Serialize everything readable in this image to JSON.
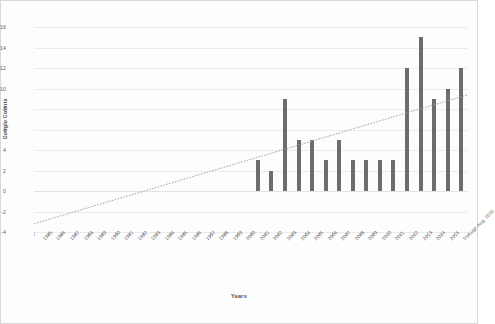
{
  "chart_data": {
    "type": "bar",
    "title": "",
    "xlabel": "Years",
    "ylabel": "Google Counts",
    "ylim": [
      -4,
      16
    ],
    "yticks": [
      16,
      14,
      12,
      10,
      8,
      6,
      4,
      2,
      0,
      -2,
      -4
    ],
    "grid": true,
    "legend": "none",
    "bar_color": "#6d6d6d",
    "trendline": {
      "label": "Linear trend",
      "style": "dotted",
      "color": "#9a9a9a",
      "y_start": -3.2,
      "y_end": 9.4
    },
    "categories": [
      "1985",
      "1986",
      "1987",
      "1988",
      "1989",
      "1990",
      "1991",
      "1992",
      "1993",
      "1994",
      "1995",
      "1996",
      "1997",
      "1998",
      "1999",
      "2000",
      "2001",
      "2002",
      "2003",
      "2004",
      "2005",
      "2006",
      "2007",
      "2008",
      "2009",
      "2010",
      "2011",
      "2012",
      "2013",
      "2014",
      "2015",
      "Through Aug. 2016"
    ],
    "values": [
      0,
      0,
      0,
      0,
      0,
      0,
      0,
      0,
      0,
      0,
      0,
      0,
      0,
      0,
      0,
      0,
      3,
      2,
      9,
      5,
      5,
      3,
      5,
      3,
      3,
      3,
      3,
      12,
      15,
      9,
      10,
      12
    ]
  },
  "axes": {
    "y_title": "Google Counts",
    "x_title": "Years"
  }
}
